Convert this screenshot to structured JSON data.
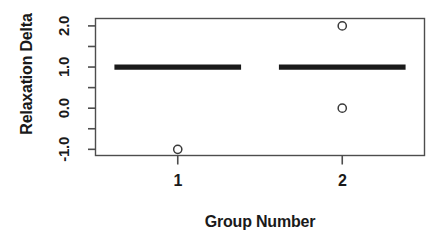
{
  "chart_data": {
    "type": "boxplot",
    "title": "",
    "xlabel": "Group Number",
    "ylabel": "Relaxation Delta",
    "categories": [
      "1",
      "2"
    ],
    "x": [
      1,
      2
    ],
    "xtick_labels": [
      "1",
      "2"
    ],
    "ytick_labels": [
      "-1.0",
      "0.0",
      "1.0",
      "2.0"
    ],
    "ytick_values": [
      -1.0,
      0.0,
      1.0,
      2.0
    ],
    "yminor_tick_values": [
      -0.5,
      0.5,
      1.5
    ],
    "ylim": [
      -1.15,
      2.18
    ],
    "xlim": [
      0.5,
      2.5
    ],
    "grid": false,
    "legend": null,
    "frame": true,
    "colors": {
      "line": "#1a1a1a",
      "box": "#1a1a1a",
      "point": "#3a3a3a",
      "axis": "#4d4d4d",
      "background": "#ffffff"
    },
    "boxes": [
      {
        "group": "1",
        "x": 1,
        "min": 1.0,
        "q1": 1.0,
        "median": 1.0,
        "q3": 1.0,
        "max": 1.0,
        "outliers": [
          -1.0
        ]
      },
      {
        "group": "2",
        "x": 2,
        "min": 1.0,
        "q1": 1.0,
        "median": 1.0,
        "q3": 1.0,
        "max": 1.0,
        "outliers": [
          2.0,
          0.0
        ]
      }
    ]
  }
}
